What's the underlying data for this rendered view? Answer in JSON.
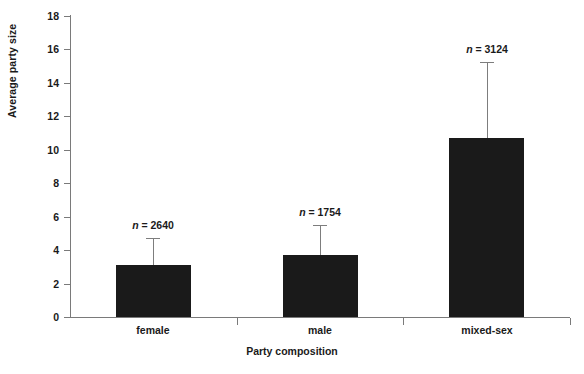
{
  "chart_data": {
    "type": "bar",
    "title": "",
    "xlabel": "Party composition",
    "ylabel": "Average party size",
    "categories": [
      "female",
      "male",
      "mixed-sex"
    ],
    "values": [
      3.1,
      3.7,
      10.7
    ],
    "error_upper": [
      4.7,
      5.5,
      15.25
    ],
    "annotations": [
      "n = 2640",
      "n = 1754",
      "n = 3124"
    ],
    "sample_sizes": [
      2640,
      1754,
      3124
    ],
    "ylim": [
      0,
      18
    ],
    "yticks": [
      0,
      2,
      4,
      6,
      8,
      10,
      12,
      14,
      16,
      18
    ],
    "ytick_labels": [
      "0",
      "2",
      "4",
      "6",
      "8",
      "10",
      "12",
      "14",
      "16",
      "18"
    ],
    "grid": false,
    "legend": "none",
    "bar_color": "#1a1a1a",
    "error_bar_color": "#7d7d7d",
    "axis_color": "#7a7a7a"
  },
  "axes": {
    "y_title": "Average party size",
    "x_title": "Party composition"
  },
  "ticks": {
    "y": [
      {
        "value": 18,
        "label": "18"
      },
      {
        "value": 16,
        "label": "16"
      },
      {
        "value": 14,
        "label": "14"
      },
      {
        "value": 12,
        "label": "12"
      },
      {
        "value": 10,
        "label": "10"
      },
      {
        "value": 8,
        "label": "8"
      },
      {
        "value": 6,
        "label": "6"
      },
      {
        "value": 4,
        "label": "4"
      },
      {
        "value": 2,
        "label": "2"
      },
      {
        "value": 0,
        "label": "0"
      }
    ]
  },
  "series": [
    {
      "category": "female",
      "value": 3.1,
      "error_upper": 4.7,
      "annotation_prefix": "n",
      "annotation_eq": " = ",
      "annotation_value": "2640"
    },
    {
      "category": "male",
      "value": 3.7,
      "error_upper": 5.5,
      "annotation_prefix": "n",
      "annotation_eq": " = ",
      "annotation_value": "1754"
    },
    {
      "category": "mixed-sex",
      "value": 10.7,
      "error_upper": 15.25,
      "annotation_prefix": "n",
      "annotation_eq": " = ",
      "annotation_value": "3124"
    }
  ],
  "caption": {
    "sliver_text": ""
  }
}
